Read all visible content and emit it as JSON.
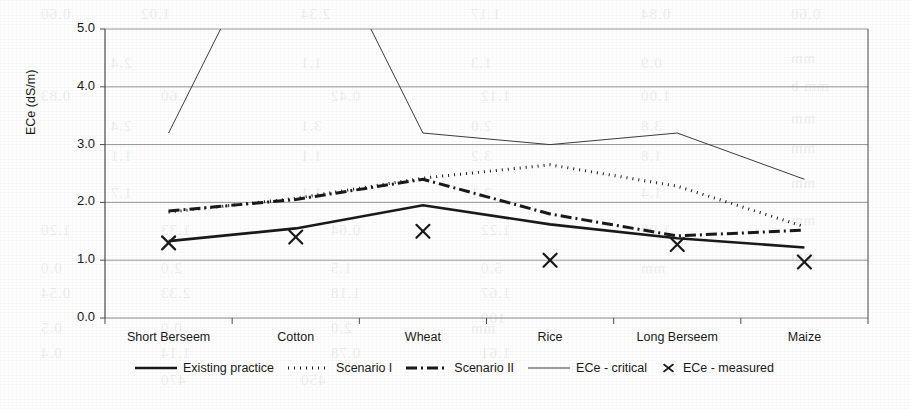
{
  "chart_data": {
    "type": "line",
    "title": "",
    "xlabel": "",
    "ylabel": "ECe (dS/m)",
    "categories": [
      "Short Berseem",
      "Cotton",
      "Wheat",
      "Rice",
      "Long Berseem",
      "Maize"
    ],
    "ylim": [
      0.0,
      5.0
    ],
    "yticks": [
      0.0,
      1.0,
      2.0,
      3.0,
      4.0,
      5.0
    ],
    "ytick_labels": [
      "0.0",
      "1.0",
      "2.0",
      "3.0",
      "4.0",
      "5.0"
    ],
    "grid": true,
    "legend_position": "bottom",
    "series": [
      {
        "name": "Existing practice",
        "style": "solid-thick",
        "values": [
          1.33,
          1.55,
          1.95,
          1.62,
          1.38,
          1.22
        ]
      },
      {
        "name": "Scenario I",
        "style": "dotted",
        "values": [
          1.83,
          2.07,
          2.42,
          2.65,
          2.28,
          1.58
        ]
      },
      {
        "name": "Scenario II",
        "style": "dash-dot-thick",
        "values": [
          1.85,
          2.05,
          2.4,
          1.8,
          1.42,
          1.52
        ]
      },
      {
        "name": "ECe - critical",
        "style": "solid-thin",
        "values": [
          3.2,
          7.6,
          3.2,
          3.0,
          3.2,
          2.4
        ],
        "clipped_above_ylim": true
      },
      {
        "name": "ECe - measured",
        "style": "x-marker",
        "values": [
          1.3,
          1.4,
          1.5,
          1.0,
          1.27,
          0.97
        ]
      }
    ]
  },
  "legend": {
    "entries": [
      {
        "label": "Existing practice",
        "style": "solid-thick"
      },
      {
        "label": "Scenario I",
        "style": "dotted"
      },
      {
        "label": "Scenario II",
        "style": "dash-dot-thick"
      },
      {
        "label": "ECe - critical",
        "style": "solid-thin"
      },
      {
        "label": "ECe - measured",
        "style": "x-marker"
      }
    ]
  },
  "colors": {
    "ink": "#1a1a1a",
    "grid": "#8c8c8c",
    "axis": "#4d4d4d",
    "background": "#ffffff"
  },
  "bleed_through": [
    {
      "text": "0.60",
      "x": 40,
      "y": 6
    },
    {
      "text": "1.02",
      "x": 140,
      "y": 6
    },
    {
      "text": "2.34",
      "x": 300,
      "y": 6
    },
    {
      "text": "1.17",
      "x": 470,
      "y": 6
    },
    {
      "text": "0.84",
      "x": 640,
      "y": 6
    },
    {
      "text": "0.60",
      "x": 790,
      "y": 6
    },
    {
      "text": "mm",
      "x": 790,
      "y": 50
    },
    {
      "text": "2.4",
      "x": 110,
      "y": 55
    },
    {
      "text": "1.1",
      "x": 300,
      "y": 55
    },
    {
      "text": "1.3",
      "x": 470,
      "y": 55
    },
    {
      "text": "0.9",
      "x": 640,
      "y": 55
    },
    {
      "text": "mm b",
      "x": 790,
      "y": 78
    },
    {
      "text": "0.83",
      "x": 40,
      "y": 88
    },
    {
      "text": "1.60",
      "x": 160,
      "y": 88
    },
    {
      "text": "0.42",
      "x": 330,
      "y": 88
    },
    {
      "text": "1.12",
      "x": 480,
      "y": 88
    },
    {
      "text": "1.00",
      "x": 640,
      "y": 88
    },
    {
      "text": "mm",
      "x": 790,
      "y": 110
    },
    {
      "text": "2.4",
      "x": 110,
      "y": 118
    },
    {
      "text": "3.1",
      "x": 300,
      "y": 118
    },
    {
      "text": "2.0",
      "x": 470,
      "y": 118
    },
    {
      "text": "3.8",
      "x": 640,
      "y": 118
    },
    {
      "text": "mm",
      "x": 790,
      "y": 140
    },
    {
      "text": "1.1",
      "x": 110,
      "y": 148
    },
    {
      "text": "1.1",
      "x": 300,
      "y": 148
    },
    {
      "text": "3.2",
      "x": 470,
      "y": 148
    },
    {
      "text": "1.8",
      "x": 640,
      "y": 148
    },
    {
      "text": "mm",
      "x": 790,
      "y": 175
    },
    {
      "text": "1.7",
      "x": 110,
      "y": 185
    },
    {
      "text": "1.1",
      "x": 300,
      "y": 185
    },
    {
      "text": "2.1",
      "x": 470,
      "y": 185
    },
    {
      "text": "1.4",
      "x": 640,
      "y": 185
    },
    {
      "text": "mm",
      "x": 790,
      "y": 212
    },
    {
      "text": "1.20",
      "x": 40,
      "y": 222
    },
    {
      "text": "1.33",
      "x": 160,
      "y": 222
    },
    {
      "text": "0.64",
      "x": 330,
      "y": 222
    },
    {
      "text": "1.22",
      "x": 480,
      "y": 222
    },
    {
      "text": "1.00",
      "x": 640,
      "y": 222
    },
    {
      "text": "mm",
      "x": 790,
      "y": 248
    },
    {
      "text": "0.0",
      "x": 40,
      "y": 260
    },
    {
      "text": "2.0",
      "x": 160,
      "y": 260
    },
    {
      "text": "1.5",
      "x": 330,
      "y": 260
    },
    {
      "text": "5.0",
      "x": 480,
      "y": 260
    },
    {
      "text": "mm",
      "x": 640,
      "y": 260
    },
    {
      "text": "0.54",
      "x": 40,
      "y": 285
    },
    {
      "text": "2.33",
      "x": 160,
      "y": 285
    },
    {
      "text": "1.18",
      "x": 330,
      "y": 285
    },
    {
      "text": "1.67",
      "x": 480,
      "y": 285
    },
    {
      "text": "100",
      "x": 480,
      "y": 310
    },
    {
      "text": "0.5",
      "x": 40,
      "y": 320
    },
    {
      "text": "0.0",
      "x": 160,
      "y": 320
    },
    {
      "text": "2.0",
      "x": 330,
      "y": 320
    },
    {
      "text": "mm",
      "x": 470,
      "y": 320
    },
    {
      "text": "0.4",
      "x": 40,
      "y": 345
    },
    {
      "text": "1.14",
      "x": 160,
      "y": 345
    },
    {
      "text": "0.78",
      "x": 330,
      "y": 345
    },
    {
      "text": "1.61",
      "x": 480,
      "y": 345
    },
    {
      "text": "470",
      "x": 160,
      "y": 372
    },
    {
      "text": "450",
      "x": 300,
      "y": 372
    }
  ]
}
